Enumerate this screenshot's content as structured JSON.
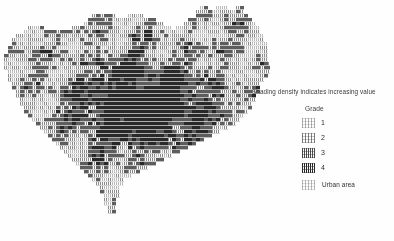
{
  "figure": {
    "kind": "grid-cell choropleth map",
    "background_color": "#ffffff",
    "ink_color": "#2b2b2b"
  },
  "legend": {
    "caption": "Shading density indicates increasing value",
    "title": "Grade",
    "entries": [
      {
        "label": "1",
        "swatch": "grade-1-swatch",
        "density": 1,
        "color": "#9a9a9a"
      },
      {
        "label": "2",
        "swatch": "grade-2-swatch",
        "density": 2,
        "color": "#7a7a7a"
      },
      {
        "label": "3",
        "swatch": "grade-3-swatch",
        "density": 3,
        "color": "#4a4a4a"
      },
      {
        "label": "4",
        "swatch": "grade-4-swatch",
        "density": 4,
        "color": "#2b2b2b"
      }
    ],
    "urban": {
      "label": "Urban area",
      "swatch": "urban-area-swatch",
      "color": "#b0b0b0"
    }
  },
  "chart_data": {
    "type": "heatmap",
    "title": "",
    "subtitle": "",
    "xlabel": "",
    "ylabel": "",
    "grid": false,
    "legend_position": "right",
    "categories": [
      "1",
      "2",
      "3",
      "4",
      "Urban area"
    ],
    "values": [
      1,
      2,
      3,
      4,
      0
    ],
    "annotations": [
      "Shading density indicates increasing value",
      "Grade"
    ],
    "cell_size_px": 4,
    "cols": 67,
    "rows": 60,
    "note": "Each map cell is shaded by grade 1-4; blank = outside region.",
    "mask_rows": [
      "                                                 XX  XXX  XX        ",
      "                                                XXXXXXXXXXXX        ",
      "                      XXXXXX   XXXX             XXXXXXXXXXXXX       ",
      "                     XXXXXXXXXXXXXXXXX        XXXXXXXXXXXXXXXX      ",
      "                    XXXXXXXXXXXXXXXXXXXX     XXXXXXXXXXXXXXXXXX     ",
      "      XXXX       XXXXXXXXXXXXXXXXXXXXXXXXX XXXXXXXXXXXXXXXXXXXXX    ",
      "     XXXXXXXXXXXXXXXXXXXXXXXXXXXXXXXXXXXXXXXXXXXXXXXXXXXXXXXXXXX    ",
      "   XXXXXXXXXXXXXXXXXXXXXXXXXXXXXXXXXXXXXXXXXXXXXXXXXXXXXXXXXXXXXX   ",
      "  XXXXXXXXXXXXXXXXXXXXXXXXXXXXXXXXXXXXXXXXXXXXXXXXXXXXXXXXXXXXXXX   ",
      "  XXXXXXXXXXXXXXXXXXXXXXXXXXXXXXXXXXXXXXXXXXXXXXXXXXXXXXXXXXXXXXXX  ",
      " XXXXXXXXXXXXXXXXXXXXXXXXXXXXXXXXXXXXXXXXXXXXXXXXXXXXXXXXXXXXXXXXX  ",
      " XXXXXXXXXXXXXXXXXXXXXXXXXXXXXXXXXXXXXXXXXXXXXXXXXXXXXXXXXXXXXXXXX  ",
      "XXXXXXXXXXXXXXXXXXXXXXXXXXXXXXXXXXXXXXXXXXXXXXXXXXXXXXXXXXXXXXXXXX  ",
      "XXXXXXXXXXXXXXXXXXXXXXXXXXXXXXXXXXXXXXXXXXXXXXXXXXXXXXXXXXXXXXXXXX  ",
      "XXXXXXXXXXXXXXXXXXXXXXXXXXXXXXXXXXXXXXXXXXXXXXXXXXXXXXXXXXXXXXXXXXX ",
      "XXXXXXXXXXXXXXXXXXXXXXXXXXXXXXXXXXXXXXXXXXXXXXXXXXXXXXXXXXXXXXXXXXX ",
      " XXXXXXXXXXXXXXXXXXXXXXXXXXXXXXXXXXXXXXXXXXXXXXXXXXXXXXXXXXXXXXXXXX ",
      " XXXXXXXXXXXXXXXXXXXXXXXXXXXXXXXXXXXXXXXXXXXXXXXXXXXXXXXXXXXXXXXXX  ",
      " XXXXXXXXXXXXXXXXXXXXXXXXXXXXXXXXXXXXXXXXXXXXXXXXXXXXXXXXXXXXXXXX   ",
      "  XXXXXXXXXXXXXXXXXXXXXXXXXXXXXXXXXXXXXXXXXXXXXXXXXXXXXXXXXXXXXX    ",
      "  XXXXXXXXXXXXXXXXXXXXXXXXXXXXXXXXXXXXXXXXXXXXXXXXXXXXXXXXXXXXXX    ",
      "   XXXXXXXXXXXXXXXXXXXXXXXXXXXXXXXXXXXXXXXXXXXXXXXXXXXXXXXXXXXXX    ",
      "   XXXXXXXXXXXXXXXXXXXXXXXXXXXXXXXXXXXXXXXXXXXXXXXXXXXXXXXXXXXX     ",
      "    XXXXXXXXXXXXXXXXXXXXXXXXXXXXXXXXXXXXXXXXXXXXXXXXXXXXXXXXXXX     ",
      "    XXXXXXXXXXXXXXXXXXXXXXXXXXXXXXXXXXXXXXXXXXXXXXXXXXXXXXXXXX      ",
      "     XXXXXXXXXXXXXXXXXXXXXXXXXXXXXXXXXXXXXXXXXXXXXXXXXXXXXXXXX      ",
      "     XXXXXXXXXXXXXXXXXXXXXXXXXXXXXXXXXXXXXXXXXXXXXXXXXXXXXXXX       ",
      "      XXXXXXXXXXXXXXXXXXXXXXXXXXXXXXXXXXXXXXXXXXXXXXXXXXXXXX        ",
      "       XXXXXXXXXXXXXXXXXXXXXXXXXXXXXXXXXXXXXXXXXXXXXXXXXXXX         ",
      "        XXXXXXXXXXXXXXXXXXXXXXXXXXXXXXXXXXXXXXXXXXXXXXXXXX          ",
      "         XXXXXXXXXXXXXXXXXXXXXXXXXXXXXXXXXXXXXXXXXXXXXXX            ",
      "          XXXXXXXXXXXXXXXXXXXXXXXXXXXXXXXXXXXXXXXXXXXX              ",
      "           XXXXXXXXXXXXXXXXXXXXXXXXXXXXXXXXXXXXXXXXX                ",
      "            XXXXXXXXXXXXXXXXXXXXXXXXXXXXXXXXXXXXXX                  ",
      "             XXXXXXXXXXXXXXXXXXXXXXXXXXXXXXXXXXX                    ",
      "              XXXXXXXXXXXXXXXXXXXXXXXXXXXXXXXX                      ",
      "               XXXXXXXXXXXXXXXXXXXXXXXXXXXXX                        ",
      "                XXXXXXXXXXXXXXXXXXXXXXXXXX                          ",
      "                 XXXXXXXXXXXXXXXXXXXXXXX                            ",
      "                  XXXXXXXXXXXXXXXXXXXX                              ",
      "                   XXXXXXXXXXXXXXXXX                                ",
      "                    XXXXXXXXXXXXXX                                  ",
      "                     XXXXXXXXXXX                                    ",
      "                      XXXXXXXX                                      ",
      "                       XXXXXXX                                      ",
      "                        XXXXX                                       ",
      "                        XXXXX                                       ",
      "                         XXXX                                       ",
      "                         XXX                                        ",
      "                         XXX                                        ",
      "                          XX                                        ",
      "                          XX                                        "
    ]
  }
}
